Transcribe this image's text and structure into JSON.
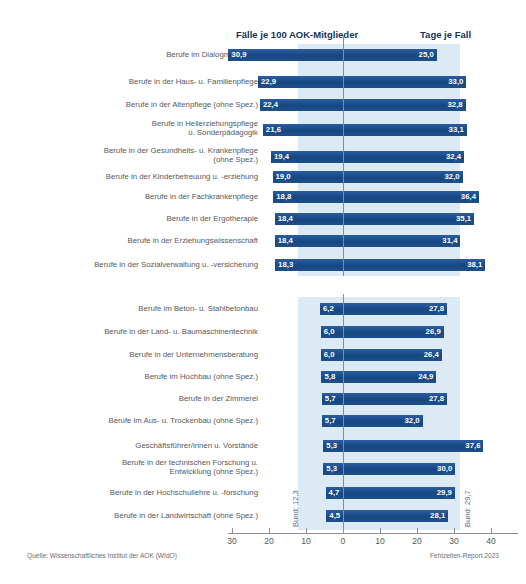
{
  "header": {
    "faelle_label": "Fälle je 100 AOK-Mitglieder",
    "tage_label": "Tage je Fall"
  },
  "annotations": {
    "bund_left": "Bund: 12,3",
    "bund_right": "Bund: 29,7"
  },
  "footer": {
    "source": "Quelle: Wissenschaftliches Institut der AOK (WIdO)",
    "report": "Fehlzeiten-Report 2023"
  },
  "axis": {
    "ticks": [
      "30",
      "20",
      "10",
      "0",
      "10",
      "20",
      "30",
      "40"
    ]
  },
  "chart_data": {
    "type": "bar",
    "title": "",
    "subtitle": "",
    "orientation": "horizontal-diverging",
    "xlabel": "",
    "ylabel": "",
    "left_series_name": "Fälle je 100 AOK-Mitglieder",
    "right_series_name": "Tage je Fall",
    "left_axis_range": [
      0,
      30
    ],
    "right_axis_range": [
      0,
      40
    ],
    "left_ticks": [
      30,
      20,
      10,
      0
    ],
    "right_ticks": [
      0,
      10,
      20,
      30,
      40
    ],
    "grid": false,
    "legend": "none",
    "reference_lines": {
      "bund_faelle": 12.3,
      "bund_tage": 29.7
    },
    "groups": [
      {
        "name": "Höchste Fallhäufigkeit",
        "categories": [
          "Berufe im Dialogmarketing",
          "Berufe in der Haus- u. Familienpflege",
          "Berufe in der Altenpflege (ohne Spez.)",
          "Berufe in Heilerziehungspflege\nu. Sonderpädagogik",
          "Berufe in der Gesundheits- u. Krankenpflege\n(ohne Spez.)",
          "Berufe in der Kinderbetreuung u. -erziehung",
          "Berufe in der Fachkrankenpflege",
          "Berufe in der Ergotherapie",
          "Berufe in der Erziehungswissenschaft",
          "Berufe in der Sozialverwaltung u. -versicherung"
        ],
        "faelle": [
          30.9,
          22.9,
          22.4,
          21.6,
          19.4,
          19.0,
          18.8,
          18.4,
          18.4,
          18.3
        ],
        "tage": [
          25.0,
          33.0,
          32.8,
          33.1,
          32.4,
          32.0,
          36.4,
          35.1,
          31.4,
          38.1
        ],
        "faelle_labels": [
          "30,9",
          "22,9",
          "22,4",
          "21,6",
          "19,4",
          "19,0",
          "18,8",
          "18,4",
          "18,4",
          "18,3"
        ],
        "tage_labels": [
          "25,0",
          "33,0",
          "32,8",
          "33,1",
          "32,4",
          "32,0",
          "36,4",
          "35,1",
          "31,4",
          "38,1"
        ]
      },
      {
        "name": "Niedrigste Fallhäufigkeit",
        "categories": [
          "Berufe im Beton- u. Stahlbetonbau",
          "Berufe in der Land- u. Baumaschinentechnik",
          "Berufe in der Unternehmensberatung",
          "Berufe im Hochbau (ohne Spez.)",
          "Berufe in der Zimmerei",
          "Berufe im Aus- u. Trockenbau (ohne Spez.)",
          "Geschäftsführer/innen u. Vorstände",
          "Berufe in der technischen Forschung u.\nEntwicklung (ohne Spez.)",
          "Berufe in der Hochschullehre u. -forschung",
          "Berufe in der Landwirtschaft (ohne Spez.)"
        ],
        "faelle": [
          6.2,
          6.0,
          6.0,
          5.8,
          5.7,
          5.7,
          5.3,
          5.3,
          4.7,
          4.5
        ],
        "tage": [
          27.8,
          26.9,
          26.4,
          24.9,
          27.8,
          21.2,
          37.6,
          30.0,
          29.9,
          28.1
        ],
        "faelle_labels": [
          "6,2",
          "6,0",
          "6,0",
          "5,8",
          "5,7",
          "5,7",
          "5,3",
          "5,3",
          "4,7",
          "4,5"
        ],
        "tage_labels": [
          "27,8",
          "26,9",
          "26,4",
          "24,9",
          "27,8",
          "32,0",
          "37,6",
          "30,0",
          "29,9",
          "28,1"
        ]
      }
    ]
  }
}
